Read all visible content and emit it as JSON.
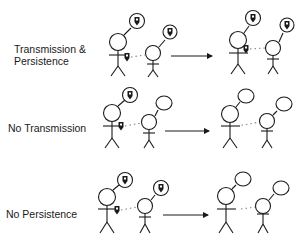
{
  "diagram": {
    "rows": [
      {
        "label": "Transmission &\nPersistence",
        "before": {
          "speaker_thought": "idea",
          "listener_thought": "idea",
          "held_token": true
        },
        "after": {
          "speaker_thought": "idea",
          "listener_thought": "idea",
          "held_token": true
        }
      },
      {
        "label": "No Transmission",
        "before": {
          "speaker_thought": "idea",
          "listener_thought": "empty",
          "held_token": true
        },
        "after": {
          "speaker_thought": "empty",
          "listener_thought": "empty",
          "held_token": false
        }
      },
      {
        "label": "No Persistence",
        "before": {
          "speaker_thought": "idea",
          "listener_thought": "idea",
          "held_token": true
        },
        "after": {
          "speaker_thought": "empty",
          "listener_thought": "empty",
          "held_token": false
        }
      }
    ],
    "colors": {
      "stroke": "#1a1a1a",
      "background": "#ffffff",
      "dotted_link": "#888888"
    }
  }
}
